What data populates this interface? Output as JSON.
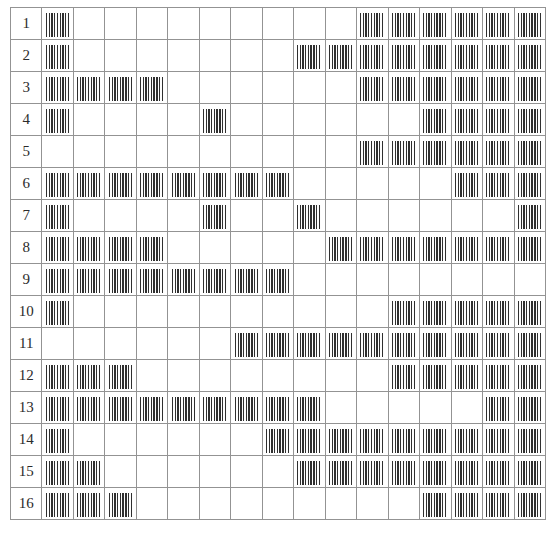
{
  "figure": {
    "name": "binary-pattern-matrix",
    "rows": 16,
    "columns": 16,
    "filled_glyph": "vertical-stripes-block",
    "empty_glyph": "blank-cell",
    "colors": {
      "grid_line": "#939393",
      "stripe_dark": "#2f2f2f",
      "stripe_light": "#fdfdfd",
      "background": "#ffffff",
      "label_text": "#2b2b2b"
    }
  },
  "row_labels": [
    "1",
    "2",
    "3",
    "4",
    "5",
    "6",
    "7",
    "8",
    "9",
    "10",
    "11",
    "12",
    "13",
    "14",
    "15",
    "16"
  ],
  "chart_data": {
    "type": "heatmap",
    "title": "",
    "xlabel": "",
    "ylabel": "",
    "categories": [
      "1",
      "2",
      "3",
      "4",
      "5",
      "6",
      "7",
      "8",
      "9",
      "10",
      "11",
      "12",
      "13",
      "14",
      "15",
      "16"
    ],
    "row_labels": [
      "1",
      "2",
      "3",
      "4",
      "5",
      "6",
      "7",
      "8",
      "9",
      "10",
      "11",
      "12",
      "13",
      "14",
      "15",
      "16"
    ],
    "legend": [],
    "grid": true,
    "value_meaning": {
      "1": "filled striped block",
      "0": "empty cell"
    },
    "values": [
      [
        1,
        0,
        0,
        0,
        0,
        0,
        0,
        0,
        0,
        0,
        1,
        1,
        1,
        1,
        1,
        1
      ],
      [
        1,
        0,
        0,
        0,
        0,
        0,
        0,
        0,
        1,
        1,
        1,
        1,
        1,
        1,
        1,
        1
      ],
      [
        1,
        1,
        1,
        1,
        0,
        0,
        0,
        0,
        0,
        0,
        1,
        1,
        1,
        1,
        1,
        1
      ],
      [
        1,
        0,
        0,
        0,
        0,
        1,
        0,
        0,
        0,
        0,
        0,
        0,
        1,
        1,
        1,
        1
      ],
      [
        0,
        0,
        0,
        0,
        0,
        0,
        0,
        0,
        0,
        0,
        1,
        1,
        1,
        1,
        1,
        1
      ],
      [
        1,
        1,
        1,
        1,
        1,
        1,
        1,
        1,
        0,
        0,
        0,
        0,
        0,
        1,
        1,
        1
      ],
      [
        1,
        0,
        0,
        0,
        0,
        1,
        0,
        0,
        1,
        0,
        0,
        0,
        0,
        0,
        0,
        1
      ],
      [
        1,
        1,
        1,
        1,
        0,
        0,
        0,
        0,
        0,
        1,
        1,
        1,
        1,
        1,
        1,
        1
      ],
      [
        1,
        1,
        1,
        1,
        1,
        1,
        1,
        1,
        0,
        0,
        0,
        0,
        0,
        0,
        0,
        0
      ],
      [
        1,
        0,
        0,
        0,
        0,
        0,
        0,
        0,
        0,
        0,
        0,
        1,
        1,
        1,
        1,
        1
      ],
      [
        0,
        0,
        0,
        0,
        0,
        0,
        1,
        1,
        1,
        1,
        1,
        1,
        1,
        1,
        1,
        1
      ],
      [
        1,
        1,
        1,
        0,
        0,
        0,
        0,
        0,
        0,
        0,
        0,
        1,
        1,
        1,
        1,
        1
      ],
      [
        1,
        1,
        1,
        1,
        1,
        1,
        1,
        1,
        1,
        0,
        0,
        0,
        0,
        0,
        1,
        1
      ],
      [
        1,
        0,
        0,
        0,
        0,
        0,
        0,
        1,
        1,
        1,
        1,
        1,
        1,
        1,
        1,
        1
      ],
      [
        1,
        1,
        0,
        0,
        0,
        0,
        0,
        0,
        1,
        1,
        1,
        1,
        1,
        1,
        1,
        1
      ],
      [
        1,
        1,
        1,
        0,
        0,
        0,
        0,
        0,
        0,
        0,
        0,
        0,
        1,
        1,
        1,
        1
      ]
    ]
  }
}
